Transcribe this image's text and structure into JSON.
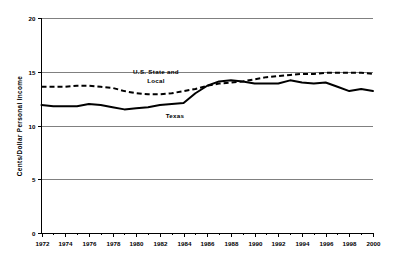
{
  "chart_data": {
    "type": "line",
    "title": "",
    "subtitle": "",
    "xlabel": "",
    "ylabel": "Cents/Dollar Personal Income",
    "xlim": [
      1972,
      2000
    ],
    "ylim": [
      0,
      20
    ],
    "yticks": [
      "0",
      "5",
      "10",
      "15",
      "20"
    ],
    "ytick_values": [
      0,
      5,
      10,
      15,
      20
    ],
    "xticks": [
      "1972",
      "1974",
      "1976",
      "1978",
      "1980",
      "1982",
      "1984",
      "1986",
      "1988",
      "1990",
      "1992",
      "1994",
      "1996",
      "1998",
      "2000"
    ],
    "xtick_values": [
      1972,
      1974,
      1976,
      1978,
      1980,
      1982,
      1984,
      1986,
      1988,
      1990,
      1992,
      1994,
      1996,
      1998,
      2000
    ],
    "grid": "horizontal",
    "legend_position": "inline-annotation",
    "x": [
      1972,
      1973,
      1974,
      1975,
      1976,
      1977,
      1978,
      1979,
      1980,
      1981,
      1982,
      1983,
      1984,
      1985,
      1986,
      1987,
      1988,
      1989,
      1990,
      1991,
      1992,
      1993,
      1994,
      1995,
      1996,
      1997,
      1998,
      1999,
      2000
    ],
    "series": [
      {
        "name": "U.S. State and Local",
        "style": "dashed",
        "color": "#000000",
        "values": [
          13.6,
          13.6,
          13.6,
          13.7,
          13.7,
          13.6,
          13.5,
          13.2,
          13.0,
          12.9,
          12.9,
          13.0,
          13.2,
          13.4,
          13.7,
          13.9,
          14.0,
          14.1,
          14.3,
          14.5,
          14.6,
          14.7,
          14.8,
          14.8,
          14.9,
          14.9,
          14.9,
          14.9,
          14.8
        ]
      },
      {
        "name": "Texas",
        "style": "solid",
        "color": "#000000",
        "values": [
          11.9,
          11.8,
          11.8,
          11.8,
          12.0,
          11.9,
          11.7,
          11.5,
          11.6,
          11.7,
          11.9,
          12.0,
          12.1,
          13.0,
          13.7,
          14.1,
          14.2,
          14.1,
          13.9,
          13.9,
          13.9,
          14.2,
          14.0,
          13.9,
          14.0,
          13.6,
          13.2,
          13.4,
          13.2
        ]
      }
    ],
    "annotations": [
      {
        "text_line1": "U.S. State and",
        "text_line2": "Local",
        "series": "U.S. State and Local"
      },
      {
        "text": "Texas",
        "series": "Texas"
      }
    ],
    "colors": {
      "axis": "#000000",
      "grid": "#808080",
      "line": "#000000",
      "background": "#ffffff"
    }
  }
}
